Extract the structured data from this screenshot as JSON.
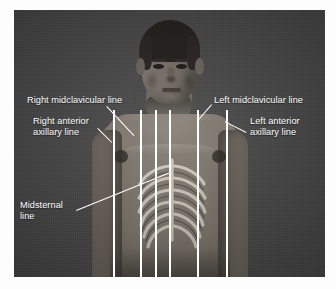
{
  "figure": {
    "kind": "anatomy-photograph",
    "background_color": "#ffffff",
    "plate_color": "#4a4a4a",
    "line_color": "#ffffff",
    "text_color": "#ffffff"
  },
  "labels": {
    "right_midclavicular": "Right midclavicular line",
    "right_anterior_axillary": "Right anterior\naxillary line",
    "left_midclavicular": "Left midclavicular line",
    "left_anterior_axillary": "Left anterior\naxillary line",
    "midsternal": "Midsternal\nline"
  },
  "reference_lines": [
    {
      "name": "right-anterior-axillary-line",
      "x": 113
    },
    {
      "name": "right-midclavicular-line",
      "x": 140
    },
    {
      "name": "right-parasternal-line",
      "x": 155
    },
    {
      "name": "midsternal-line",
      "x": 169
    },
    {
      "name": "left-midclavicular-line",
      "x": 197
    },
    {
      "name": "left-anterior-axillary-line",
      "x": 226
    }
  ],
  "leaders": [
    {
      "name": "leader-right-midclavicular",
      "x": 107,
      "y": 106,
      "length": 40,
      "angle": 47
    },
    {
      "name": "leader-right-anterior-axillary",
      "x": 98,
      "y": 128,
      "length": 20,
      "angle": 45
    },
    {
      "name": "leader-left-midclavicular",
      "x": 212,
      "y": 105,
      "length": 22,
      "angle": 131
    },
    {
      "name": "leader-left-anterior-axillary",
      "x": 246,
      "y": 133,
      "length": 24,
      "angle": 207
    },
    {
      "name": "leader-midsternal",
      "x": 76,
      "y": 210,
      "length": 100,
      "angle": -22
    }
  ]
}
